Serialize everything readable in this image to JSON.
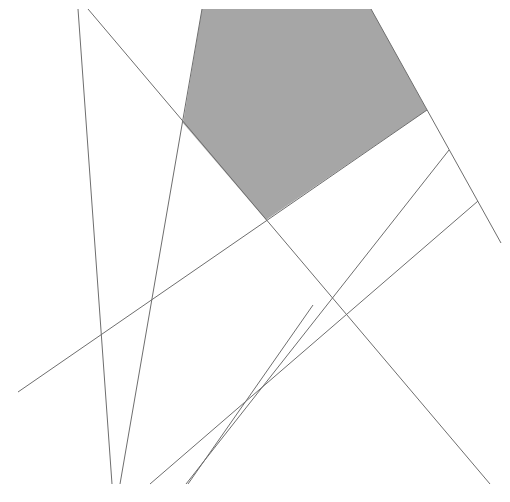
{
  "diagram": {
    "width": 510,
    "height": 502,
    "background": "#ffffff",
    "line_color": "#6e6e6e",
    "fill_color": "#a6a6a6",
    "shaded_polygon": {
      "name": "shaded-pentagon",
      "points": [
        [
          202,
          9
        ],
        [
          371,
          9
        ],
        [
          427,
          110
        ],
        [
          266,
          220
        ],
        [
          183,
          123
        ]
      ]
    },
    "lines": [
      {
        "name": "line-a",
        "x1": 78,
        "y1": 9,
        "x2": 112,
        "y2": 484
      },
      {
        "name": "line-b",
        "x1": 88,
        "y1": 9,
        "x2": 490,
        "y2": 484
      },
      {
        "name": "line-c",
        "x1": 202,
        "y1": 9,
        "x2": 120,
        "y2": 484
      },
      {
        "name": "line-d",
        "x1": 371,
        "y1": 9,
        "x2": 501,
        "y2": 243
      },
      {
        "name": "line-e",
        "x1": 18,
        "y1": 392,
        "x2": 427,
        "y2": 110
      },
      {
        "name": "line-f",
        "x1": 449,
        "y1": 150,
        "x2": 186,
        "y2": 484
      },
      {
        "name": "line-g",
        "x1": 478,
        "y1": 201,
        "x2": 150,
        "y2": 484
      },
      {
        "name": "line-h",
        "x1": 313,
        "y1": 305,
        "x2": 188,
        "y2": 484
      }
    ]
  }
}
